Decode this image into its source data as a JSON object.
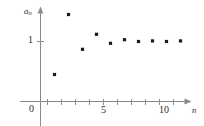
{
  "figure": {
    "background_color": "#ffffff",
    "axis_color": "#8a8a8a",
    "point_color": "#1a1a1a",
    "width": 204,
    "height": 126
  },
  "labels": {
    "y_axis_label": "a",
    "y_axis_label_subscript": "n",
    "x_axis_label": "n",
    "origin": "0",
    "y_tick_1": "1",
    "x_tick_5": "5",
    "x_tick_10": "10"
  },
  "chart_data": {
    "type": "scatter",
    "title": "",
    "xlabel": "n",
    "ylabel": "a_n",
    "xlim": [
      0,
      11.6
    ],
    "ylim": [
      0,
      1.72
    ],
    "grid": false,
    "legend": null,
    "x_ticks": [
      1,
      2,
      3,
      4,
      5,
      6,
      7,
      8,
      9,
      10
    ],
    "x_tick_labels": [
      "",
      "",
      "",
      "",
      "5",
      "",
      "",
      "",
      "",
      "10"
    ],
    "y_ticks": [
      1
    ],
    "y_tick_labels": [
      "1"
    ],
    "origin_label": "0",
    "x": [
      1,
      2,
      3,
      4,
      5,
      6,
      7,
      8,
      9,
      10
    ],
    "values": [
      0.45,
      1.45,
      0.87,
      1.12,
      0.97,
      1.03,
      1.0,
      1.01,
      1.0,
      1.01
    ],
    "point_marker": "filled-square",
    "point_size_px": 3.2
  }
}
